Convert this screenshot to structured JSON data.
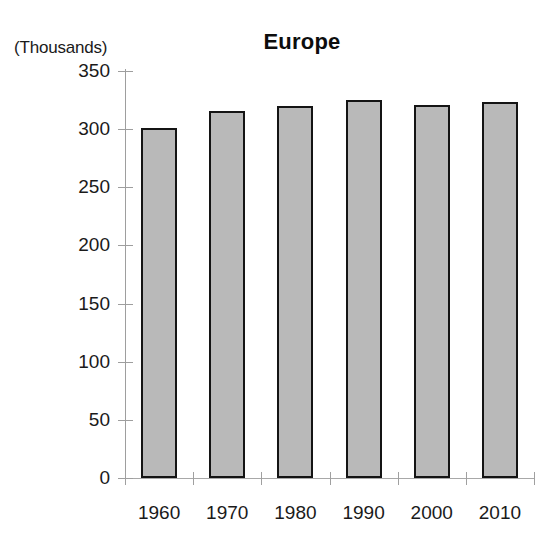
{
  "chart_data": {
    "type": "bar",
    "title": "Europe",
    "units_label": "(Thousands)",
    "xlabel": "",
    "ylabel": "",
    "categories": [
      "1960",
      "1970",
      "1980",
      "1990",
      "2000",
      "2010"
    ],
    "values": [
      301,
      316,
      320,
      325,
      321,
      323
    ],
    "ylim": [
      0,
      350
    ],
    "ytick_values": [
      350,
      300,
      250,
      200,
      150,
      100,
      50,
      0
    ],
    "ytick_labels": [
      "350",
      "300",
      "250",
      "200",
      "150",
      "100",
      "50",
      "0"
    ],
    "grid": false,
    "legend": null,
    "series": [
      {
        "name": "Europe",
        "values": [
          301,
          316,
          320,
          325,
          321,
          323
        ]
      }
    ],
    "colors": {
      "bar_fill": "#b9b9b9",
      "bar_border": "#141414",
      "axis": "#9e9e9e",
      "text": "#1a1a1a",
      "background": "#ffffff"
    }
  }
}
